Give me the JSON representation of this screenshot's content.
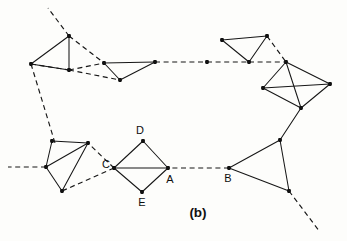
{
  "figure": {
    "caption": "(b)",
    "caption_position": {
      "x": 198,
      "y": 217
    },
    "background_color": "#fdfdfb",
    "ink_color": "#161616",
    "node_color": "#111111",
    "width": 347,
    "height": 241
  },
  "chart_data": {
    "type": "diagram",
    "title": "(b)",
    "nodes": [
      {
        "id": "n1",
        "x": 69,
        "y": 36,
        "label": ""
      },
      {
        "id": "n2",
        "x": 69,
        "y": 70,
        "label": ""
      },
      {
        "id": "n3",
        "x": 31,
        "y": 64,
        "label": ""
      },
      {
        "id": "n4",
        "x": 104,
        "y": 63,
        "label": ""
      },
      {
        "id": "n5",
        "x": 120,
        "y": 80,
        "label": ""
      },
      {
        "id": "n6",
        "x": 155,
        "y": 62,
        "label": ""
      },
      {
        "id": "n7",
        "x": 207,
        "y": 62,
        "label": ""
      },
      {
        "id": "n8",
        "x": 222,
        "y": 40,
        "label": ""
      },
      {
        "id": "n9",
        "x": 267,
        "y": 36,
        "label": ""
      },
      {
        "id": "n10",
        "x": 249,
        "y": 62,
        "label": ""
      },
      {
        "id": "n11",
        "x": 286,
        "y": 62,
        "label": ""
      },
      {
        "id": "n12",
        "x": 263,
        "y": 88,
        "label": ""
      },
      {
        "id": "n13",
        "x": 330,
        "y": 84,
        "label": ""
      },
      {
        "id": "n14",
        "x": 301,
        "y": 108,
        "label": ""
      },
      {
        "id": "n15",
        "x": 280,
        "y": 140,
        "label": ""
      },
      {
        "id": "n16",
        "x": 229,
        "y": 168,
        "label": "B"
      },
      {
        "id": "n17",
        "x": 289,
        "y": 191,
        "label": ""
      },
      {
        "id": "n18",
        "x": 168,
        "y": 168,
        "label": "A"
      },
      {
        "id": "n19",
        "x": 143,
        "y": 141,
        "label": "D"
      },
      {
        "id": "n20",
        "x": 114,
        "y": 168,
        "label": "C"
      },
      {
        "id": "n21",
        "x": 142,
        "y": 192,
        "label": "E"
      },
      {
        "id": "n22",
        "x": 88,
        "y": 143,
        "label": ""
      },
      {
        "id": "n23",
        "x": 46,
        "y": 167,
        "label": ""
      },
      {
        "id": "n24",
        "x": 62,
        "y": 191,
        "label": ""
      },
      {
        "id": "n25",
        "x": 52,
        "y": 141,
        "label": ""
      }
    ],
    "solid_edges": [
      [
        "n1",
        "n2"
      ],
      [
        "n1",
        "n3"
      ],
      [
        "n2",
        "n3"
      ],
      [
        "n4",
        "n5"
      ],
      [
        "n4",
        "n6"
      ],
      [
        "n5",
        "n6"
      ],
      [
        "n8",
        "n9"
      ],
      [
        "n8",
        "n10"
      ],
      [
        "n9",
        "n10"
      ],
      [
        "n11",
        "n12"
      ],
      [
        "n11",
        "n13"
      ],
      [
        "n11",
        "n14"
      ],
      [
        "n12",
        "n13"
      ],
      [
        "n12",
        "n14"
      ],
      [
        "n13",
        "n14"
      ],
      [
        "n14",
        "n15"
      ],
      [
        "n15",
        "n16"
      ],
      [
        "n15",
        "n17"
      ],
      [
        "n16",
        "n17"
      ],
      [
        "n18",
        "n19"
      ],
      [
        "n18",
        "n20"
      ],
      [
        "n18",
        "n21"
      ],
      [
        "n19",
        "n20"
      ],
      [
        "n20",
        "n21"
      ],
      [
        "n22",
        "n23"
      ],
      [
        "n22",
        "n24"
      ],
      [
        "n22",
        "n25"
      ],
      [
        "n23",
        "n24"
      ],
      [
        "n23",
        "n25"
      ]
    ],
    "dashed_edges": [
      [
        "n1",
        "n4"
      ],
      [
        "n2",
        "n4"
      ],
      [
        "n2",
        "n5"
      ],
      [
        "n3",
        "n2"
      ],
      [
        "n6",
        "n7"
      ],
      [
        "n7",
        "n10"
      ],
      [
        "n9",
        "n11"
      ],
      [
        "n10",
        "n11"
      ],
      [
        "n16",
        "n18"
      ],
      [
        "n20",
        "n22"
      ],
      [
        "n20",
        "n24"
      ]
    ],
    "dashed_rays": [
      {
        "from": "n1",
        "to": {
          "x": 48,
          "y": 8
        }
      },
      {
        "from": "n3",
        "to": {
          "x": 55,
          "y": 143
        }
      },
      {
        "from": "n23",
        "to": {
          "x": 8,
          "y": 167
        }
      },
      {
        "from": "n17",
        "to": {
          "x": 320,
          "y": 232
        }
      }
    ],
    "vertex_labels": [
      {
        "text": "D",
        "x": 140,
        "y": 134,
        "anchor": "middle"
      },
      {
        "text": "C",
        "x": 106,
        "y": 168,
        "anchor": "middle"
      },
      {
        "text": "A",
        "x": 170,
        "y": 183,
        "anchor": "middle"
      },
      {
        "text": "E",
        "x": 142,
        "y": 206,
        "anchor": "middle"
      },
      {
        "text": "B",
        "x": 228,
        "y": 182,
        "anchor": "middle"
      }
    ]
  }
}
